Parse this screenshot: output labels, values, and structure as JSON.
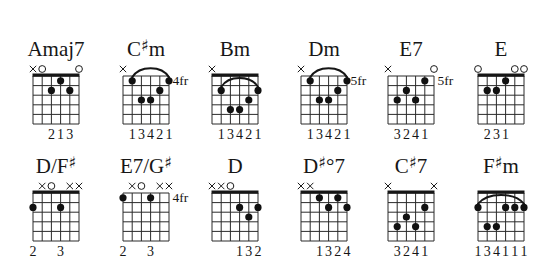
{
  "sheet": {
    "background": "#ffffff",
    "ink": "#161616"
  },
  "diagram": {
    "strings": 6,
    "frets": 5
  },
  "chords": [
    {
      "name": "Amaj7",
      "nut": true,
      "markers": [
        "x",
        "o",
        null,
        null,
        null,
        "o"
      ],
      "barre": null,
      "dots": [
        [
          3,
          2
        ],
        [
          4,
          1
        ],
        [
          5,
          2
        ]
      ],
      "fret_label": null,
      "fingers": [
        null,
        null,
        "2",
        "1",
        "3",
        null
      ]
    },
    {
      "name": "C♯m",
      "nut": false,
      "markers": [
        "x",
        null,
        null,
        null,
        null,
        null
      ],
      "barre": {
        "from": 2,
        "to": 6,
        "fret": 1
      },
      "dots": [
        [
          2,
          1
        ],
        [
          3,
          3
        ],
        [
          4,
          3
        ],
        [
          5,
          2
        ],
        [
          6,
          1
        ]
      ],
      "fret_label": "4fr",
      "fingers": [
        null,
        "1",
        "3",
        "4",
        "2",
        "1"
      ]
    },
    {
      "name": "Bm",
      "nut": true,
      "markers": [
        "x",
        null,
        null,
        null,
        null,
        null
      ],
      "barre": {
        "from": 2,
        "to": 6,
        "fret": 2
      },
      "dots": [
        [
          2,
          2
        ],
        [
          3,
          4
        ],
        [
          4,
          4
        ],
        [
          5,
          3
        ],
        [
          6,
          2
        ]
      ],
      "fret_label": null,
      "fingers": [
        null,
        "1",
        "3",
        "4",
        "2",
        "1"
      ]
    },
    {
      "name": "Dm",
      "nut": false,
      "markers": [
        "x",
        null,
        null,
        null,
        null,
        null
      ],
      "barre": {
        "from": 2,
        "to": 6,
        "fret": 1
      },
      "dots": [
        [
          2,
          1
        ],
        [
          3,
          3
        ],
        [
          4,
          3
        ],
        [
          5,
          2
        ],
        [
          6,
          1
        ]
      ],
      "fret_label": "5fr",
      "fingers": [
        null,
        "1",
        "3",
        "4",
        "2",
        "1"
      ]
    },
    {
      "name": "E7",
      "nut": false,
      "markers": [
        "x",
        null,
        null,
        null,
        null,
        "o"
      ],
      "barre": null,
      "dots": [
        [
          2,
          3
        ],
        [
          3,
          2
        ],
        [
          4,
          3
        ],
        [
          5,
          1
        ]
      ],
      "fret_label": "5fr",
      "fingers": [
        null,
        "3",
        "2",
        "4",
        "1",
        null
      ]
    },
    {
      "name": "E",
      "nut": true,
      "markers": [
        "o",
        null,
        null,
        null,
        "o",
        "o"
      ],
      "barre": null,
      "dots": [
        [
          2,
          2
        ],
        [
          3,
          2
        ],
        [
          4,
          1
        ]
      ],
      "fret_label": null,
      "fingers": [
        null,
        "2",
        "3",
        "1",
        null,
        null
      ]
    },
    {
      "name": "D/F♯",
      "nut": true,
      "markers": [
        null,
        "x",
        "o",
        null,
        "x",
        "x"
      ],
      "barre": null,
      "dots": [
        [
          1,
          2
        ],
        [
          4,
          2
        ]
      ],
      "fret_label": null,
      "fingers": [
        "2",
        null,
        null,
        "3",
        null,
        null
      ]
    },
    {
      "name": "E7/G♯",
      "nut": false,
      "markers": [
        null,
        "x",
        "o",
        null,
        "x",
        "x"
      ],
      "barre": null,
      "dots": [
        [
          1,
          1
        ],
        [
          4,
          1
        ]
      ],
      "fret_label": "4fr",
      "fingers": [
        "2",
        null,
        null,
        "3",
        null,
        null
      ]
    },
    {
      "name": "D",
      "nut": true,
      "markers": [
        "x",
        "x",
        "o",
        null,
        null,
        null
      ],
      "barre": null,
      "dots": [
        [
          4,
          2
        ],
        [
          5,
          3
        ],
        [
          6,
          2
        ]
      ],
      "fret_label": null,
      "fingers": [
        null,
        null,
        null,
        "1",
        "3",
        "2"
      ]
    },
    {
      "name": "D♯°7",
      "nut": true,
      "markers": [
        "x",
        "x",
        null,
        null,
        null,
        null
      ],
      "barre": null,
      "dots": [
        [
          3,
          1
        ],
        [
          4,
          2
        ],
        [
          5,
          1
        ],
        [
          6,
          2
        ]
      ],
      "fret_label": null,
      "fingers": [
        null,
        null,
        "1",
        "3",
        "2",
        "4"
      ]
    },
    {
      "name": "C♯7",
      "nut": true,
      "markers": [
        "x",
        null,
        null,
        null,
        null,
        "x"
      ],
      "barre": null,
      "dots": [
        [
          2,
          4
        ],
        [
          3,
          3
        ],
        [
          4,
          4
        ],
        [
          5,
          2
        ]
      ],
      "fret_label": null,
      "fingers": [
        null,
        "3",
        "2",
        "4",
        "1",
        null
      ]
    },
    {
      "name": "F♯m",
      "nut": true,
      "markers": [
        null,
        null,
        null,
        null,
        null,
        null
      ],
      "barre": {
        "from": 1,
        "to": 6,
        "fret": 2
      },
      "dots": [
        [
          1,
          2
        ],
        [
          2,
          4
        ],
        [
          3,
          4
        ],
        [
          4,
          2
        ],
        [
          5,
          2
        ],
        [
          6,
          2
        ]
      ],
      "fret_label": null,
      "fingers": [
        "1",
        "3",
        "4",
        "1",
        "1",
        "1"
      ]
    }
  ]
}
